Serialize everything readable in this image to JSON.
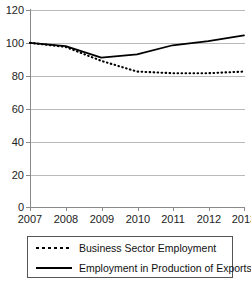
{
  "chart_data": {
    "type": "line",
    "title": "",
    "xlabel": "",
    "ylabel": "",
    "categories": [
      "2007",
      "2008",
      "2009",
      "2010",
      "2011",
      "2012",
      "2013"
    ],
    "x": [
      2007,
      2008,
      2009,
      2010,
      2011,
      2012,
      2013
    ],
    "ylim": [
      0,
      120
    ],
    "yticks": [
      0,
      20,
      40,
      60,
      80,
      100,
      120
    ],
    "ytick_labels": [
      "0",
      "20",
      "40",
      "60",
      "80",
      "100",
      "120"
    ],
    "grid": "horizontal",
    "legend_position": "bottom",
    "series": [
      {
        "name": "Business Sector Employment",
        "style": "dotted",
        "color": "#000000",
        "values": [
          100,
          97.5,
          89,
          82.5,
          81.5,
          81.5,
          82.5
        ]
      },
      {
        "name": "Employment in Production of Exports",
        "style": "solid",
        "color": "#000000",
        "values": [
          100,
          98,
          91,
          93,
          98.5,
          101,
          104.5
        ]
      }
    ]
  },
  "axes": {
    "y": {
      "ticks": [
        {
          "label": "120",
          "value": 120
        },
        {
          "label": "100",
          "value": 100
        },
        {
          "label": "80",
          "value": 80
        },
        {
          "label": "60",
          "value": 60
        },
        {
          "label": "40",
          "value": 40
        },
        {
          "label": "20",
          "value": 20
        },
        {
          "label": "0",
          "value": 0
        }
      ]
    },
    "x": {
      "ticks": [
        {
          "label": "2007"
        },
        {
          "label": "2008"
        },
        {
          "label": "2009"
        },
        {
          "label": "2010"
        },
        {
          "label": "2011"
        },
        {
          "label": "2012"
        },
        {
          "label": "2013"
        }
      ]
    }
  },
  "legend": {
    "entries": [
      {
        "label": "Business Sector Employment",
        "style": "dotted"
      },
      {
        "label": "Employment in Production of Exports",
        "style": "solid"
      }
    ]
  },
  "colors": {
    "grid": "#b9b9b9",
    "axis": "#8a8a8a",
    "series": "#000000",
    "legend_border": "#555555",
    "background": "#ffffff"
  }
}
